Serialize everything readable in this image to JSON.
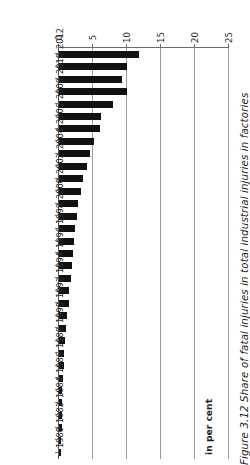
{
  "figure": {
    "caption": "Figure 3.12  Share of fatal injuries in total industrial injuries in factories",
    "caption_number": "Figure 3.12",
    "caption_text": "Share of fatal injuries in total industrial injuries in factories"
  },
  "axes": {
    "value_axis_title": "in per cent",
    "value_axis_ticks": [
      "0",
      "5",
      "10",
      "15",
      "20",
      "25"
    ],
    "value_axis_min": 0,
    "value_axis_max": 25,
    "category_axis_title": "",
    "category_tick_labels": [
      "1980",
      "1982",
      "1984",
      "1986",
      "1988",
      "1990",
      "1992",
      "1994",
      "1996",
      "1998",
      "2000",
      "2002",
      "2004",
      "2006",
      "2008",
      "2010",
      "2012"
    ]
  },
  "style": {
    "bar_color": "#111111",
    "grid_color": "#9a9a9a",
    "axis_color": "#6b6b6b",
    "background": "#ffffff"
  },
  "chart_data": {
    "type": "bar",
    "orientation": "horizontal",
    "title": "",
    "subtitle": "",
    "xlabel": "in per cent",
    "ylabel": "",
    "xlim": [
      0,
      25
    ],
    "grid": true,
    "legend": false,
    "rotation_deg": 180,
    "categories": [
      "1980",
      "1981",
      "1982",
      "1983",
      "1984",
      "1985",
      "1986",
      "1987",
      "1988",
      "1989",
      "1990",
      "1991",
      "1992",
      "1993",
      "1994",
      "1995",
      "1996",
      "1997",
      "1998",
      "1999",
      "2000",
      "2001",
      "2002",
      "2003",
      "2004",
      "2005",
      "2006",
      "2007",
      "2008",
      "2009",
      "2010",
      "2011",
      "2012"
    ],
    "values": [
      0.3,
      0.3,
      0.4,
      0.4,
      0.5,
      0.5,
      0.6,
      0.7,
      0.8,
      0.9,
      1.0,
      1.2,
      1.4,
      1.5,
      1.7,
      1.9,
      2.1,
      2.2,
      2.4,
      2.6,
      2.8,
      3.2,
      3.5,
      4.1,
      4.6,
      5.2,
      6.1,
      6.2,
      8.0,
      10.0,
      9.3,
      10.0,
      11.8
    ],
    "tick_step": 5,
    "label_step_years": 2
  }
}
